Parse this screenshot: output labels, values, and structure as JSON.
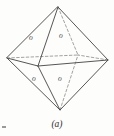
{
  "figure": {
    "caption": "(a)",
    "shape": "octahedron",
    "stroke_color": "#4d4d4d",
    "dashed_stroke_color": "#8a8a8a",
    "background_color": "#fdfdfc",
    "label_color": "#4a4a4a",
    "vertices": {
      "top": {
        "x": 58,
        "y": 7
      },
      "bottom": {
        "x": 60,
        "y": 110
      },
      "left": {
        "x": 7,
        "y": 58
      },
      "right": {
        "x": 108,
        "y": 60
      },
      "front": {
        "x": 38,
        "y": 66
      },
      "back": {
        "x": 78,
        "y": 55
      }
    },
    "solid_edges": [
      {
        "from": "top",
        "to": "left"
      },
      {
        "from": "top",
        "to": "right"
      },
      {
        "from": "top",
        "to": "front"
      },
      {
        "from": "bottom",
        "to": "left"
      },
      {
        "from": "bottom",
        "to": "right"
      },
      {
        "from": "bottom",
        "to": "front"
      },
      {
        "from": "left",
        "to": "front"
      },
      {
        "from": "right",
        "to": "front"
      }
    ],
    "dashed_edges": [
      {
        "from": "top",
        "to": "back"
      },
      {
        "from": "bottom",
        "to": "back"
      },
      {
        "from": "left",
        "to": "back"
      },
      {
        "from": "right",
        "to": "back"
      }
    ],
    "face_labels": [
      {
        "id": "upper-left",
        "text": "o",
        "x": 33,
        "y": 38
      },
      {
        "id": "upper-right",
        "text": "o",
        "x": 62,
        "y": 36
      },
      {
        "id": "lower-left",
        "text": "o",
        "x": 36,
        "y": 79
      },
      {
        "id": "lower-right",
        "text": "o",
        "x": 61,
        "y": 79
      }
    ]
  }
}
